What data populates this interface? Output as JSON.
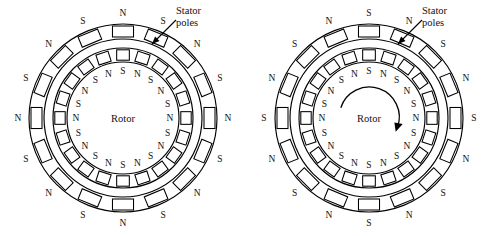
{
  "figure": {
    "type": "diagram",
    "background_color": "#ffffff",
    "line_color": "#000000",
    "panel_count": 2
  },
  "labels": {
    "rotor": "Rotor",
    "callout_line1": "Stator",
    "callout_line2": "poles",
    "north": "N",
    "south": "S"
  },
  "panels": [
    {
      "id": "left",
      "rotor_center_label": "Rotor",
      "callout": {
        "line1": "Stator",
        "line2": "poles"
      },
      "has_rotation_arrow": false,
      "rotation_direction": "",
      "stator": {
        "pole_count": 16,
        "top_polarity": "N",
        "start_angle_deg": -90,
        "polarities": [
          "N",
          "S",
          "N",
          "S",
          "N",
          "S",
          "N",
          "S",
          "N",
          "S",
          "N",
          "S",
          "N",
          "S",
          "N",
          "S"
        ]
      },
      "rotor": {
        "pole_count": 20,
        "top_polarity": "S",
        "start_angle_deg": -90,
        "polarities": [
          "S",
          "N",
          "S",
          "N",
          "S",
          "N",
          "S",
          "N",
          "S",
          "N",
          "S",
          "N",
          "S",
          "N",
          "S",
          "N",
          "S",
          "N",
          "S",
          "N"
        ]
      }
    },
    {
      "id": "right",
      "rotor_center_label": "Rotor",
      "callout": {
        "line1": "Stator",
        "line2": "poles"
      },
      "has_rotation_arrow": true,
      "rotation_direction": "clockwise",
      "stator": {
        "pole_count": 16,
        "top_polarity": "S",
        "start_angle_deg": -90,
        "polarities": [
          "S",
          "N",
          "S",
          "N",
          "S",
          "N",
          "S",
          "N",
          "S",
          "N",
          "S",
          "N",
          "S",
          "N",
          "S",
          "N"
        ]
      },
      "rotor": {
        "pole_count": 20,
        "top_polarity": "S",
        "start_angle_deg": -90,
        "polarities": [
          "S",
          "N",
          "S",
          "N",
          "S",
          "N",
          "S",
          "N",
          "S",
          "N",
          "S",
          "N",
          "S",
          "N",
          "S",
          "N",
          "S",
          "N",
          "S",
          "N"
        ]
      }
    }
  ],
  "geometry": {
    "center_x": 123,
    "center_y": 118,
    "stator_outer_r": 94,
    "stator_inner_r": 79,
    "rotor_outer_r": 70,
    "rotor_body_r": 56,
    "stator_label_r": 105,
    "rotor_label_r": 47,
    "callout": {
      "text_x": 176,
      "text_y": 14,
      "tip_x": 152,
      "tip_y": 44,
      "tail_x": 176,
      "tail_y": 20
    }
  }
}
